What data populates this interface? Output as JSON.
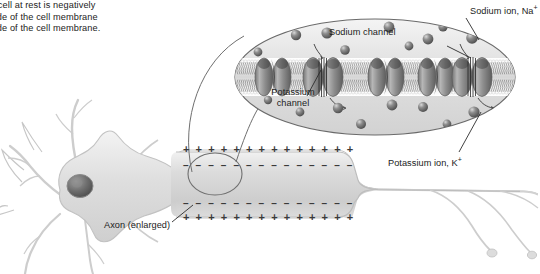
{
  "figure": {
    "type": "biology-diagram"
  },
  "caption": {
    "lines": [
      "e cell at rest is negatively",
      "side of the cell membrane",
      "side of the cell membrane."
    ]
  },
  "labels": {
    "sodium_ion": "Sodium ion, Na",
    "sodium_ion_charge": "+",
    "sodium_channel": "Sodium channel",
    "potassium_channel_line1": "Potassium",
    "potassium_channel_line2": "channel",
    "potassium_ion": "Potassium ion, K",
    "potassium_ion_charge": "+",
    "axon_enlarged": "Axon (enlarged)"
  },
  "charges": {
    "positive_symbol": "+",
    "negative_symbol": "–",
    "outer_top_count": 14,
    "inner_top_count": 14,
    "inner_bottom_count": 14,
    "outer_bottom_count": 14,
    "outer_sign": "+",
    "inner_sign": "–"
  },
  "magnified_membrane": {
    "channel_count": 5,
    "channels": [
      {
        "index": 0,
        "kind": "closed"
      },
      {
        "index": 1,
        "kind": "potassium"
      },
      {
        "index": 2,
        "kind": "closed"
      },
      {
        "index": 3,
        "kind": "closed"
      },
      {
        "index": 4,
        "kind": "sodium"
      }
    ],
    "ions_above": 9,
    "ions_below": 8,
    "bilayer_description": "phospholipid bilayer with embedded channel proteins"
  },
  "colors": {
    "ion_fill": "#6e6e6e",
    "ion_highlight": "#c9c9c9",
    "channel_fill": "#9a9a9a",
    "channel_dark": "#3a3a3a",
    "cell_fill": "#e2e2e2",
    "cell_stroke": "#9d9d9d",
    "oval_stroke": "#555555",
    "leader_line": "#2b2b2b",
    "text": "#1b1b1b",
    "membrane_band": "#f2f2f2"
  }
}
